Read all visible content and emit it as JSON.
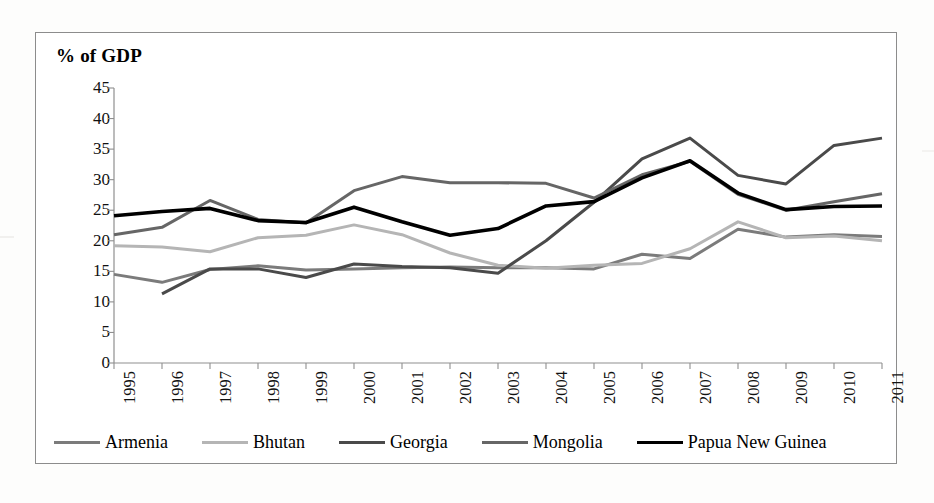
{
  "chart_data": {
    "type": "line",
    "title": "% of GDP",
    "xlabel": "",
    "ylabel": "% of GDP",
    "ylim": [
      0,
      45
    ],
    "ytick_step": 5,
    "yticks": [
      0,
      5,
      10,
      15,
      20,
      25,
      30,
      35,
      40,
      45
    ],
    "grid": false,
    "legend_position": "bottom",
    "categories": [
      "1995",
      "1996",
      "1997",
      "1998",
      "1999",
      "2000",
      "2001",
      "2002",
      "2003",
      "2004",
      "2005",
      "2006",
      "2007",
      "2008",
      "2009",
      "2010",
      "2011"
    ],
    "x": [
      1995,
      1996,
      1997,
      1998,
      1999,
      2000,
      2001,
      2002,
      2003,
      2004,
      2005,
      2006,
      2007,
      2008,
      2009,
      2010,
      2011
    ],
    "series": [
      {
        "name": "Armenia",
        "color": "#7b7b7b",
        "width": 3.0,
        "values": [
          14.5,
          13.2,
          15.3,
          15.9,
          15.2,
          15.4,
          15.6,
          15.7,
          15.6,
          15.6,
          15.4,
          17.8,
          17.1,
          21.9,
          20.6,
          21.0,
          20.7
        ]
      },
      {
        "name": "Bhutan",
        "color": "#b5b5b5",
        "width": 3.0,
        "values": [
          19.2,
          19.0,
          18.2,
          20.5,
          20.9,
          22.6,
          21.0,
          18.0,
          16.0,
          15.5,
          16.0,
          16.3,
          18.7,
          23.1,
          20.5,
          20.8,
          20.0
        ]
      },
      {
        "name": "Georgia",
        "color": "#4a4a4a",
        "width": 3.0,
        "values": [
          null,
          11.3,
          15.4,
          15.4,
          14.0,
          16.2,
          15.8,
          15.6,
          14.7,
          20.0,
          26.3,
          33.4,
          36.8,
          30.7,
          29.3,
          35.6,
          36.8
        ]
      },
      {
        "name": "Mongolia",
        "color": "#666666",
        "width": 3.0,
        "values": [
          21.0,
          22.2,
          26.6,
          23.5,
          22.9,
          28.2,
          30.5,
          29.5,
          29.5,
          29.4,
          27.0,
          30.8,
          33.0,
          27.6,
          25.0,
          26.4,
          27.7
        ]
      },
      {
        "name": "Papua New Guinea",
        "color": "#000000",
        "width": 3.6,
        "values": [
          24.1,
          24.8,
          25.3,
          23.3,
          23.0,
          25.5,
          23.1,
          20.9,
          22.0,
          25.7,
          26.4,
          30.3,
          33.1,
          27.8,
          25.1,
          25.6,
          25.7
        ]
      }
    ]
  },
  "legend": {
    "items": [
      {
        "label": "Armenia"
      },
      {
        "label": "Bhutan"
      },
      {
        "label": "Georgia"
      },
      {
        "label": "Mongolia"
      },
      {
        "label": "Papua New Guinea"
      }
    ]
  }
}
